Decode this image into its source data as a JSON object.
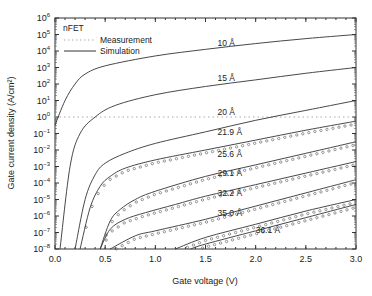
{
  "chart_data": {
    "type": "line",
    "title": "",
    "annotation": "nFET",
    "xlabel": "Gate voltage (V)",
    "ylabel": "Gate current density (A/cm²)",
    "xlim": [
      0.0,
      3.0
    ],
    "ylim_log10": [
      -8,
      6
    ],
    "yscale": "log",
    "x_ticks": [
      "0.0",
      "0.5",
      "1.0",
      "1.5",
      "2.0",
      "2.5",
      "3.0"
    ],
    "y_ticks": [
      "10^6",
      "10^5",
      "10^4",
      "10^3",
      "10^2",
      "10^1",
      "10^0",
      "10^-1",
      "10^-2",
      "10^-3",
      "10^-4",
      "10^-5",
      "10^-6",
      "10^-7",
      "10^-8"
    ],
    "legend": [
      {
        "label": "Measurement",
        "style": "dotted"
      },
      {
        "label": "Simulation",
        "style": "solid"
      }
    ],
    "grid": false,
    "series": [
      {
        "name": "10 Å",
        "x": [
          0.0,
          0.1,
          0.2,
          0.3,
          0.5,
          1.0,
          1.5,
          2.0,
          2.5,
          3.0
        ],
        "log10_y": [
          -0.5,
          1.0,
          2.0,
          2.6,
          3.1,
          3.7,
          4.1,
          4.45,
          4.75,
          5.0
        ],
        "measured": false,
        "label_at": [
          1.62,
          4.3
        ]
      },
      {
        "name": "15 Å",
        "x": [
          0.05,
          0.15,
          0.25,
          0.4,
          0.6,
          1.0,
          1.5,
          2.0,
          2.5,
          3.0
        ],
        "log10_y": [
          -8,
          -3,
          -1.0,
          0.0,
          0.7,
          1.35,
          1.85,
          2.25,
          2.65,
          3.0
        ],
        "measured": false,
        "label_at": [
          1.62,
          2.2
        ]
      },
      {
        "name": "20 Å",
        "x": [
          0.2,
          0.3,
          0.4,
          0.5,
          0.7,
          1.0,
          1.5,
          2.0,
          2.5,
          3.0
        ],
        "log10_y": [
          -8,
          -5,
          -3.5,
          -2.8,
          -2.2,
          -1.6,
          -0.9,
          -0.2,
          0.4,
          1.0
        ],
        "measured": false,
        "label_at": [
          1.62,
          0.15
        ]
      },
      {
        "name": "21.9 Å",
        "x": [
          0.25,
          0.35,
          0.45,
          0.55,
          0.7,
          1.0,
          1.5,
          2.0,
          2.5,
          3.0
        ],
        "log10_y": [
          -8,
          -5.5,
          -4.2,
          -3.6,
          -3.1,
          -2.6,
          -2.0,
          -1.4,
          -0.8,
          -0.25
        ],
        "measured": true,
        "label_at": [
          1.62,
          -1.1
        ]
      },
      {
        "name": "25.6 Å",
        "x": [
          0.45,
          0.55,
          0.65,
          0.8,
          1.0,
          1.5,
          2.0,
          2.5,
          3.0
        ],
        "log10_y": [
          -8,
          -6.3,
          -5.6,
          -5.0,
          -4.5,
          -3.6,
          -2.9,
          -2.2,
          -1.5
        ],
        "measured": true,
        "label_at": [
          1.62,
          -2.4
        ]
      },
      {
        "name": "29.1 Å",
        "x": [
          0.45,
          0.55,
          0.7,
          0.9,
          1.2,
          1.5,
          2.0,
          2.5,
          3.0
        ],
        "log10_y": [
          -8,
          -6.8,
          -6.2,
          -5.8,
          -5.3,
          -4.8,
          -4.1,
          -3.4,
          -2.7
        ],
        "measured": true,
        "label_at": [
          1.62,
          -3.6
        ]
      },
      {
        "name": "32.2 Å",
        "x": [
          0.55,
          0.8,
          1.0,
          1.5,
          2.0,
          2.5,
          3.0
        ],
        "log10_y": [
          -8,
          -7.2,
          -6.9,
          -6.2,
          -5.4,
          -4.6,
          -3.8
        ],
        "measured": true,
        "label_at": [
          1.62,
          -4.8
        ]
      },
      {
        "name": "35.0 Å",
        "x": [
          1.2,
          1.5,
          2.0,
          2.5,
          3.0
        ],
        "log10_y": [
          -8,
          -7.3,
          -6.5,
          -5.7,
          -5.0
        ],
        "measured": true,
        "label_at": [
          1.62,
          -6.0
        ]
      },
      {
        "name": "36.1 Å",
        "x": [
          1.35,
          1.5,
          2.0,
          2.5,
          3.0
        ],
        "log10_y": [
          -8,
          -7.7,
          -6.9,
          -6.1,
          -5.3
        ],
        "measured": true,
        "label_at": [
          2.0,
          -7.0
        ]
      }
    ],
    "reference_line_log10": 0
  }
}
